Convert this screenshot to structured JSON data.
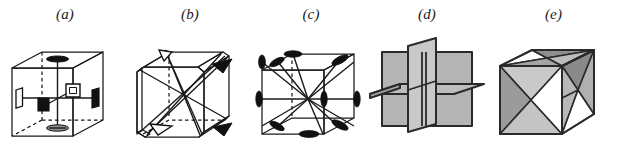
{
  "figure": {
    "background_color": "#ffffff",
    "stroke_color": "#1a1a1a",
    "fill_gray_light": "#c9c9c9",
    "fill_gray_mid": "#b4b4b4",
    "fill_gray_dark": "#8a8a8a",
    "fill_white": "#ffffff"
  },
  "panels": [
    {
      "id": "a",
      "label": "(a)",
      "caption": "four-fold rotation axes through face centres",
      "symmetry_order": 4,
      "axis_count": 3,
      "marker_shape": "square",
      "markers": [
        "filled-lens-top",
        "filled-lens-bottom",
        "filled-square-front",
        "open-square-back",
        "open-rect-left",
        "filled-rect-right"
      ],
      "cube_style": "outline-with-dashed-hidden-edges"
    },
    {
      "id": "b",
      "label": "(b)",
      "caption": "three-fold rotation axes along body diagonals",
      "symmetry_order": 3,
      "axis_count": 4,
      "marker_shape": "triangle",
      "markers": [
        "filled-triangle",
        "open-triangle"
      ],
      "cube_style": "truncated-corners"
    },
    {
      "id": "c",
      "label": "(c)",
      "caption": "two-fold rotation axes through opposite edge midpoints",
      "symmetry_order": 2,
      "axis_count": 6,
      "marker_shape": "lens",
      "markers": [
        "filled-lens"
      ],
      "cube_style": "outline"
    },
    {
      "id": "d",
      "label": "(d)",
      "caption": "three axial mirror planes parallel to cube faces",
      "plane_count": 3,
      "plane_type": "axial",
      "cube_style": "planes-only"
    },
    {
      "id": "e",
      "label": "(e)",
      "caption": "six diagonal mirror planes",
      "plane_count": 6,
      "plane_type": "diagonal",
      "cube_style": "cube-with-diagonal-facets"
    }
  ]
}
